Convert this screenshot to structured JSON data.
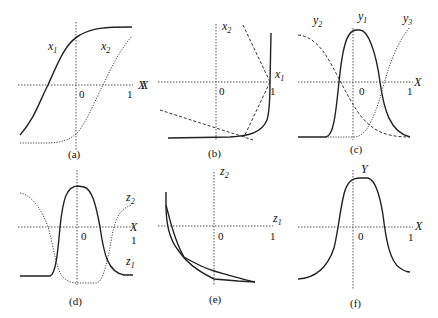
{
  "panels": [
    {
      "id": "a",
      "caption": "(a)",
      "axis_x_label": "X",
      "tick_0": "0",
      "tick_1": "1",
      "curve_labels": [
        {
          "base": "x",
          "sub": "1"
        },
        {
          "base": "x",
          "sub": "2"
        }
      ]
    },
    {
      "id": "b",
      "caption": "(b)",
      "axis_x_label": "X",
      "tick_0": "0",
      "tick_1": "1",
      "axis_labels": [
        {
          "base": "x",
          "sub": "2"
        },
        {
          "base": "x",
          "sub": "1"
        }
      ]
    },
    {
      "id": "c",
      "caption": "(c)",
      "axis_x_label": "X",
      "tick_0": "0",
      "tick_1": "1",
      "curve_labels": [
        {
          "base": "y",
          "sub": "2"
        },
        {
          "base": "y",
          "sub": "1"
        },
        {
          "base": "y",
          "sub": "3"
        }
      ]
    },
    {
      "id": "d",
      "caption": "(d)",
      "axis_x_label": "X",
      "tick_0": "0",
      "tick_1": "1",
      "curve_labels": [
        {
          "base": "z",
          "sub": "2"
        },
        {
          "base": "z",
          "sub": "1"
        }
      ]
    },
    {
      "id": "e",
      "caption": "(e)",
      "tick_0": "0",
      "tick_1": "1",
      "axis_labels": [
        {
          "base": "z",
          "sub": "2"
        },
        {
          "base": "z",
          "sub": "1"
        }
      ]
    },
    {
      "id": "f",
      "caption": "(f)",
      "axis_x_label": "X",
      "axis_y_label": "Y",
      "tick_0": "0",
      "tick_1": "1"
    }
  ]
}
